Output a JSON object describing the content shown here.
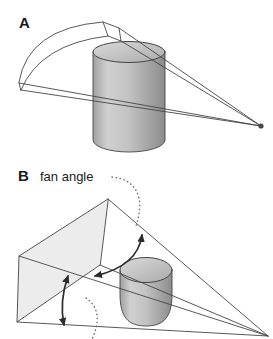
{
  "figure": {
    "background": "#ffffff",
    "panel_a": {
      "label": "A"
    },
    "panel_b": {
      "label": "B",
      "fan_angle_label": "fan angle"
    },
    "colors": {
      "outline": "#454545",
      "arrow": "#2b2b2b",
      "leader_dots": "#666666",
      "fan_plane_fill": "#ececec",
      "band_fill": "#ffffff",
      "cylinder_edge_dark": "#a0a0a0",
      "cylinder_light": "#d0d0d0",
      "cylinder_mid": "#c2c2c2",
      "cylinder_dark": "#8c8c8c",
      "cylinder_top_light": "#dadada",
      "cylinder_top_dark": "#ababab",
      "source_dot": "#474747",
      "label_text": "#1a1a1a"
    }
  }
}
